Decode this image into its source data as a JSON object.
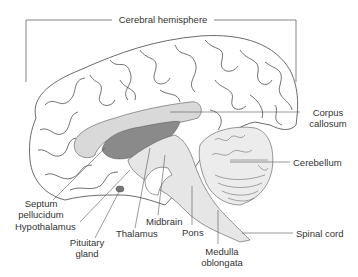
{
  "title": "Cerebral hemisphere",
  "labels": {
    "cerebral_hemisphere": "Cerebral hemisphere",
    "corpus_callosum_1": "Corpus",
    "corpus_callosum_2": "callosum",
    "cerebellum": "Cerebellum",
    "septum_pellucidum_1": "Septum",
    "septum_pellucidum_2": "pellucidum",
    "hypothalamus": "Hypothalamus",
    "pituitary_gland_1": "Pituitary",
    "pituitary_gland_2": "gland",
    "thalamus": "Thalamus",
    "midbrain": "Midbrain",
    "pons": "Pons",
    "medulla_oblongata_1": "Medulla",
    "medulla_oblongata_2": "oblongata",
    "spinal_cord": "Spinal cord"
  },
  "colors": {
    "outline": "#444444",
    "light_fill": "#d9d9d9",
    "dark_fill": "#8a8a8a",
    "leader": "#555555"
  }
}
